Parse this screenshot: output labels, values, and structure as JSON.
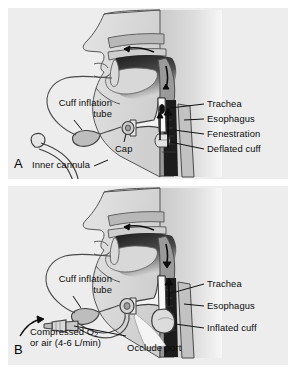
{
  "figure": {
    "type": "medical-illustration",
    "background_color": "#ffffff",
    "panel_background_color": "#ededed",
    "ink_color": "#0b0b0b"
  },
  "panel_a": {
    "letter": "A",
    "labels": {
      "cuff_inflation_tube_line1": "Cuff inflation",
      "cuff_inflation_tube_line2": "tube",
      "inner_cannula": "Inner cannula",
      "cap": "Cap",
      "trachea": "Trachea",
      "esophagus": "Esophagus",
      "fenestration": "Fenestration",
      "deflated_cuff": "Deflated cuff"
    }
  },
  "panel_b": {
    "letter": "B",
    "labels": {
      "cuff_inflation_tube_line1": "Cuff inflation",
      "cuff_inflation_tube_line2": "tube",
      "compressed_gas_line1_pre": "Compressed O",
      "compressed_gas_line1_sub": "2",
      "compressed_gas_line2": "or air (4-6 L/min)",
      "occlude_port": "Occlude port",
      "trachea": "Trachea",
      "esophagus": "Esophagus",
      "inflated_cuff": "Inflated cuff"
    }
  }
}
